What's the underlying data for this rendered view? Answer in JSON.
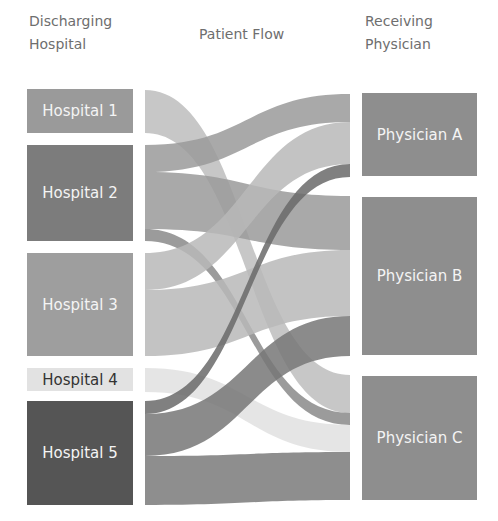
{
  "headers": {
    "left_line1": "Discharging",
    "left_line2": "Hospital",
    "middle": "Patient Flow",
    "right_line1": "Receiving",
    "right_line2": "Physician"
  },
  "hospitals": [
    {
      "label": "Hospital 1",
      "color": "#9a9a9a",
      "text_color": "#f4f4f4",
      "y0": 89,
      "y1": 133
    },
    {
      "label": "Hospital 2",
      "color": "#7c7c7c",
      "text_color": "#f4f4f4",
      "y0": 145,
      "y1": 241
    },
    {
      "label": "Hospital 3",
      "color": "#9e9e9e",
      "text_color": "#f4f4f4",
      "y0": 253,
      "y1": 356
    },
    {
      "label": "Hospital 4",
      "color": "#e2e2e2",
      "text_color": "#333333",
      "y0": 368,
      "y1": 391
    },
    {
      "label": "Hospital 5",
      "color": "#555555",
      "text_color": "#f4f4f4",
      "y0": 401,
      "y1": 505
    }
  ],
  "physicians": [
    {
      "label": "Physician A",
      "color": "#8e8e8e",
      "y0": 93,
      "y1": 176
    },
    {
      "label": "Physician B",
      "color": "#8e8e8e",
      "y0": 197,
      "y1": 355
    },
    {
      "label": "Physician C",
      "color": "#8e8e8e",
      "y0": 376,
      "y1": 500
    }
  ],
  "chart_data": {
    "type": "sankey",
    "title": "Patient Flow",
    "source_label": "Discharging Hospital",
    "target_label": "Receiving Physician",
    "links": [
      {
        "source": "Hospital 1",
        "target": "Physician C",
        "value": 44,
        "color": "#bdbdbd",
        "sy0": 90,
        "sy1": 133,
        "ty0": 375,
        "ty1": 413
      },
      {
        "source": "Hospital 2",
        "target": "Physician A",
        "value": 28,
        "color": "#9a9a9a",
        "sy0": 145,
        "sy1": 172,
        "ty0": 94,
        "ty1": 122
      },
      {
        "source": "Hospital 2",
        "target": "Physician B",
        "value": 56,
        "color": "#9a9a9a",
        "sy0": 172,
        "sy1": 229,
        "ty0": 196,
        "ty1": 250
      },
      {
        "source": "Hospital 2",
        "target": "Physician C",
        "value": 12,
        "color": "#8a8a8a",
        "sy0": 229,
        "sy1": 241,
        "ty0": 413,
        "ty1": 425
      },
      {
        "source": "Hospital 3",
        "target": "Physician A",
        "value": 42,
        "color": "#b8b8b8",
        "sy0": 253,
        "sy1": 290,
        "ty0": 122,
        "ty1": 164
      },
      {
        "source": "Hospital 3",
        "target": "Physician B",
        "value": 66,
        "color": "#b8b8b8",
        "sy0": 290,
        "sy1": 356,
        "ty0": 250,
        "ty1": 316
      },
      {
        "source": "Hospital 4",
        "target": "Physician C",
        "value": 27,
        "color": "#e0e0e0",
        "sy0": 368,
        "sy1": 392,
        "ty0": 425,
        "ty1": 452
      },
      {
        "source": "Hospital 5",
        "target": "Physician A",
        "value": 13,
        "color": "#6a6a6a",
        "sy0": 401,
        "sy1": 414,
        "ty0": 164,
        "ty1": 177
      },
      {
        "source": "Hospital 5",
        "target": "Physician B",
        "value": 40,
        "color": "#777777",
        "sy0": 414,
        "sy1": 456,
        "ty0": 316,
        "ty1": 356
      },
      {
        "source": "Hospital 5",
        "target": "Physician C",
        "value": 48,
        "color": "#7a7a7a",
        "sy0": 456,
        "sy1": 505,
        "ty0": 452,
        "ty1": 500
      }
    ]
  }
}
